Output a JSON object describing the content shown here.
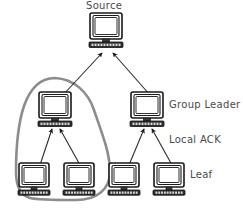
{
  "diagram": {
    "title": "Source",
    "canvas": {
      "width": 243,
      "height": 211
    },
    "background_color": "#ffffff",
    "line_color": "#2b2b2b",
    "label_color": "#4a4a4a",
    "group_outline_color": "#8c8c8c"
  },
  "labels": {
    "source": "Source",
    "group_leader": "Group Leader",
    "local_ack": "Local ACK",
    "leaf": "Leaf"
  },
  "nodes": [
    {
      "id": "source",
      "role": "source",
      "label": "Source",
      "x": 106,
      "y": 26
    },
    {
      "id": "leader-left",
      "role": "group-leader",
      "label": "",
      "x": 55,
      "y": 105
    },
    {
      "id": "leader-right",
      "role": "group-leader",
      "label": "Group Leader",
      "x": 147,
      "y": 105
    },
    {
      "id": "leaf-1",
      "role": "leaf",
      "label": "",
      "x": 34,
      "y": 175
    },
    {
      "id": "leaf-2",
      "role": "leaf",
      "label": "",
      "x": 79,
      "y": 175
    },
    {
      "id": "leaf-3",
      "role": "leaf",
      "label": "",
      "x": 124,
      "y": 175
    },
    {
      "id": "leaf-4",
      "role": "leaf",
      "label": "Leaf",
      "x": 169,
      "y": 175
    }
  ],
  "edges": [
    {
      "from": "leader-left",
      "to": "source",
      "kind": "upstream"
    },
    {
      "from": "leader-right",
      "to": "source",
      "kind": "upstream"
    },
    {
      "from": "leaf-1",
      "to": "leader-left",
      "kind": "local-ack"
    },
    {
      "from": "leaf-2",
      "to": "leader-left",
      "kind": "local-ack"
    },
    {
      "from": "leaf-3",
      "to": "leader-right",
      "kind": "local-ack"
    },
    {
      "from": "leaf-4",
      "to": "leader-right",
      "kind": "local-ack"
    }
  ],
  "group_region": {
    "name": "local-group",
    "encloses": [
      "leader-left",
      "leaf-1",
      "leaf-2"
    ]
  }
}
